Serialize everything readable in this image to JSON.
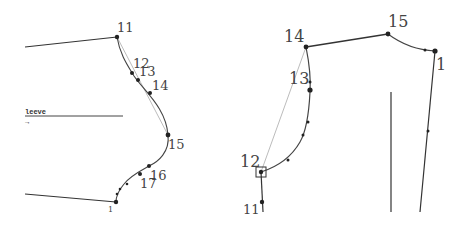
{
  "panels": [
    {
      "id": "left",
      "description": "sleeve cap curve",
      "tag": "leeve",
      "points": {
        "p11": {
          "label": "11",
          "x": 117,
          "y": 37
        },
        "p12": {
          "label": "12",
          "x": 132,
          "y": 73
        },
        "p13": {
          "label": "13",
          "x": 138,
          "y": 80
        },
        "p14": {
          "label": "14",
          "x": 150,
          "y": 93
        },
        "p15": {
          "label": "15",
          "x": 168,
          "y": 135
        },
        "p16": {
          "label": "16",
          "x": 149,
          "y": 166
        },
        "p17": {
          "label": "17",
          "x": 140,
          "y": 174
        },
        "p1": {
          "label": "1",
          "x": 116,
          "y": 202
        }
      }
    },
    {
      "id": "right",
      "description": "bodice armhole and shoulder",
      "points": {
        "p14": {
          "label": "14",
          "x": 306,
          "y": 47
        },
        "p13": {
          "label": "13",
          "x": 310,
          "y": 90
        },
        "p15": {
          "label": "15",
          "x": 388,
          "y": 34
        },
        "p1": {
          "label": "1",
          "x": 435,
          "y": 51
        },
        "p12": {
          "label": "12",
          "x": 261,
          "y": 172
        },
        "p11": {
          "label": "11",
          "x": 262,
          "y": 202
        }
      }
    }
  ],
  "colors": {
    "line": "#333333",
    "guide": "#aaaaaa",
    "point": "#222222",
    "label": "#444444"
  }
}
